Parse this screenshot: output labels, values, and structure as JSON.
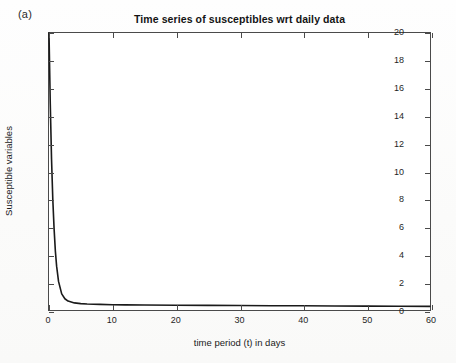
{
  "panel": {
    "label": "(a)"
  },
  "chart_data": {
    "type": "line",
    "title": "Time series of susceptibles wrt daily data",
    "xlabel": "time period (t) in days",
    "ylabel": "Susceptible variables",
    "xlim": [
      0,
      60
    ],
    "ylim": [
      0,
      20
    ],
    "xticks": [
      0,
      10,
      20,
      30,
      40,
      50,
      60
    ],
    "yticks": [
      0,
      2,
      4,
      6,
      8,
      10,
      12,
      14,
      16,
      18,
      20
    ],
    "xticklabels": [
      "0",
      "10",
      "20",
      "30",
      "40",
      "50",
      "60"
    ],
    "yticklabels": [
      "0",
      "2",
      "4",
      "6",
      "8",
      "10",
      "12",
      "14",
      "16",
      "18",
      "20"
    ],
    "grid": false,
    "legend": null,
    "series": [
      {
        "name": "Susceptible variables",
        "color": "#1a1a1a",
        "linewidth": 1.6,
        "x": [
          0,
          0.2,
          0.4,
          0.6,
          0.8,
          1.0,
          1.2,
          1.5,
          2,
          2.5,
          3,
          4,
          5,
          6,
          8,
          10,
          12,
          15,
          20,
          25,
          30,
          35,
          40,
          45,
          50,
          55,
          60
        ],
        "y": [
          20.0,
          14.9,
          10.9,
          8.0,
          5.9,
          4.3,
          3.2,
          2.1,
          1.2,
          0.85,
          0.68,
          0.55,
          0.5,
          0.47,
          0.44,
          0.42,
          0.41,
          0.4,
          0.38,
          0.37,
          0.36,
          0.35,
          0.34,
          0.33,
          0.32,
          0.31,
          0.3
        ]
      }
    ]
  }
}
